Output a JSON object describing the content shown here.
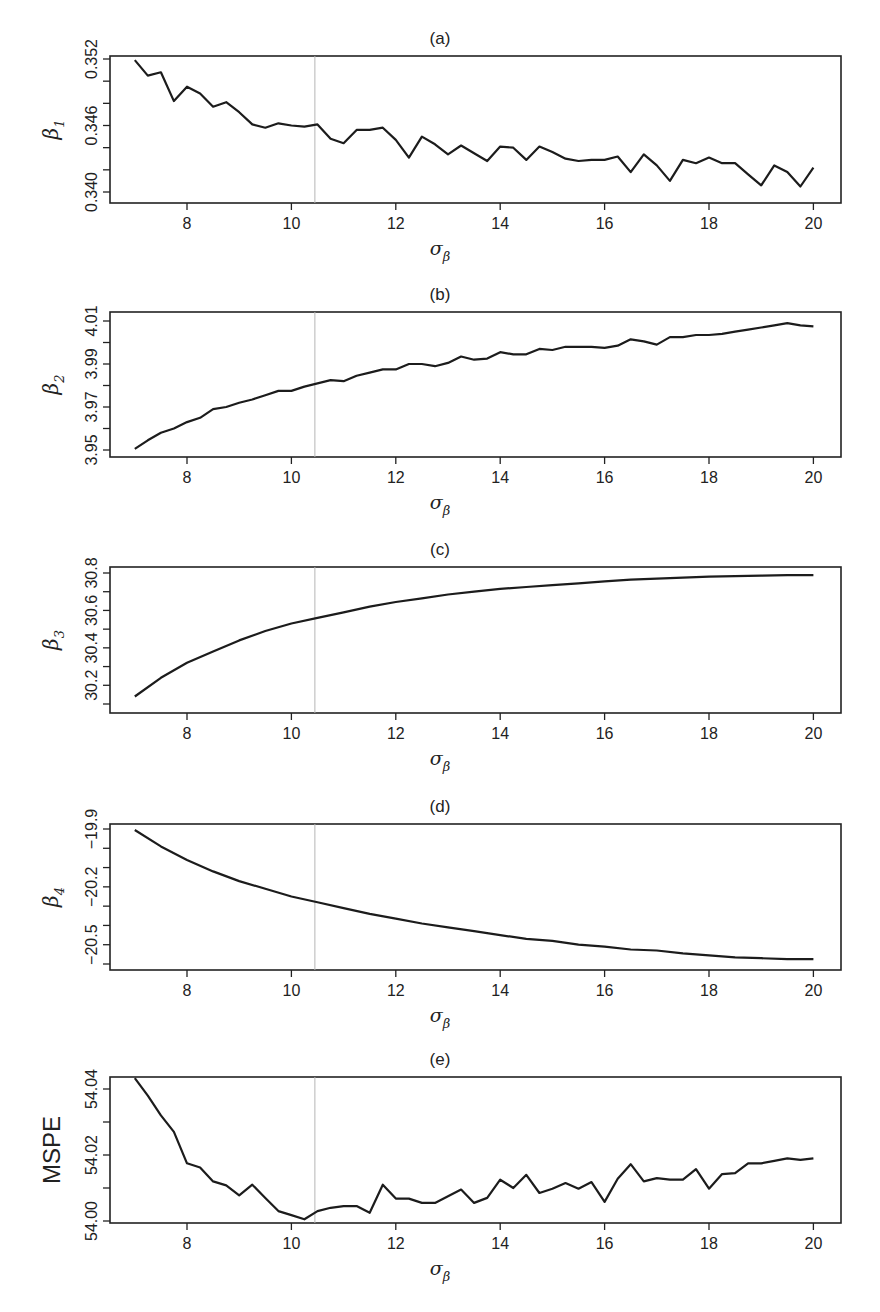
{
  "figure": {
    "x_axis": {
      "label": "σ",
      "label_subscript": "β",
      "ticks": [
        8,
        10,
        12,
        14,
        16,
        18,
        20
      ],
      "range": [
        6.52,
        20.52
      ]
    },
    "reference_line_x": 10.45
  },
  "chart_data": [
    {
      "type": "line",
      "panel": "(a)",
      "title": "(a)",
      "xlabel": "σβ",
      "ylabel": "β1",
      "ylabel_main": "β",
      "ylabel_sub": "1",
      "ylim": [
        0.3394,
        0.3527
      ],
      "yticks": [
        0.34,
        0.342,
        0.344,
        0.346,
        0.348,
        0.35,
        0.352
      ],
      "ytick_labels": [
        "0.340",
        "",
        "",
        "0.346",
        "",
        "",
        "0.352"
      ],
      "grid": false,
      "box": {
        "top": 56,
        "bottom": 203
      },
      "tick_px": {
        "top_value": 0.352,
        "top_y": 59,
        "bottom_value": 0.34,
        "bottom_y": 192
      },
      "x": [
        7,
        7.25,
        7.5,
        7.75,
        8,
        8.25,
        8.5,
        8.75,
        9,
        9.25,
        9.5,
        9.75,
        10,
        10.25,
        10.5,
        10.75,
        11,
        11.25,
        11.5,
        11.75,
        12,
        12.25,
        12.5,
        12.75,
        13,
        13.25,
        13.5,
        13.75,
        14,
        14.25,
        14.5,
        14.75,
        15,
        15.25,
        15.5,
        15.75,
        16,
        16.25,
        16.5,
        16.75,
        17,
        17.25,
        17.5,
        17.75,
        18,
        18.25,
        18.5,
        18.75,
        19,
        19.25,
        19.5,
        19.75,
        20
      ],
      "values": [
        0.3519,
        0.3505,
        0.3508,
        0.3482,
        0.3495,
        0.3489,
        0.3477,
        0.3481,
        0.3472,
        0.3461,
        0.3458,
        0.3462,
        0.346,
        0.3459,
        0.3461,
        0.3448,
        0.3444,
        0.3456,
        0.3456,
        0.3458,
        0.3447,
        0.3431,
        0.345,
        0.3443,
        0.3434,
        0.3442,
        0.3435,
        0.3428,
        0.3441,
        0.344,
        0.3429,
        0.3441,
        0.3436,
        0.343,
        0.3428,
        0.3429,
        0.3429,
        0.3432,
        0.3418,
        0.3434,
        0.3424,
        0.341,
        0.3429,
        0.3426,
        0.3431,
        0.3426,
        0.3426,
        0.3416,
        0.3406,
        0.3424,
        0.3418,
        0.3405,
        0.3422
      ]
    },
    {
      "type": "line",
      "panel": "(b)",
      "title": "(b)",
      "xlabel": "σβ",
      "ylabel": "β2",
      "ylabel_main": "β",
      "ylabel_sub": "2",
      "ylim": [
        3.9473,
        4.0143
      ],
      "yticks": [
        3.95,
        3.96,
        3.97,
        3.98,
        3.99,
        4.0,
        4.01
      ],
      "ytick_labels": [
        "3.95",
        "",
        "3.97",
        "",
        "3.99",
        "",
        "4.01"
      ],
      "grid": false,
      "box": {
        "top": 312,
        "bottom": 457
      },
      "tick_px": {
        "top_value": 4.01,
        "top_y": 321,
        "bottom_value": 3.95,
        "bottom_y": 450
      },
      "x": [
        7,
        7.25,
        7.5,
        7.75,
        8,
        8.25,
        8.5,
        8.75,
        9,
        9.25,
        9.5,
        9.75,
        10,
        10.25,
        10.5,
        10.75,
        11,
        11.25,
        11.5,
        11.75,
        12,
        12.25,
        12.5,
        12.75,
        13,
        13.25,
        13.5,
        13.75,
        14,
        14.25,
        14.5,
        14.75,
        15,
        15.25,
        15.5,
        15.75,
        16,
        16.25,
        16.5,
        16.75,
        17,
        17.25,
        17.5,
        17.75,
        18,
        18.25,
        18.5,
        18.75,
        19,
        19.25,
        19.5,
        19.75,
        20
      ],
      "values": [
        3.9505,
        3.9545,
        3.958,
        3.96,
        3.963,
        3.965,
        3.969,
        3.97,
        3.972,
        3.9735,
        3.9755,
        3.9775,
        3.9775,
        3.9795,
        3.981,
        3.9825,
        3.982,
        3.9845,
        3.986,
        3.9875,
        3.9875,
        3.99,
        3.99,
        3.989,
        3.9905,
        3.9935,
        3.992,
        3.9925,
        3.9955,
        3.9945,
        3.9945,
        3.997,
        3.9965,
        3.998,
        3.998,
        3.998,
        3.9975,
        3.9985,
        4.0015,
        4.0005,
        3.999,
        4.0025,
        4.0025,
        4.0035,
        4.0035,
        4.004,
        4.005,
        4.006,
        4.007,
        4.008,
        4.009,
        4.008,
        4.0075
      ]
    },
    {
      "type": "line",
      "panel": "(c)",
      "title": "(c)",
      "xlabel": "σβ",
      "ylabel": "β3",
      "ylabel_main": "β",
      "ylabel_sub": "3",
      "ylim": [
        30.03,
        30.83
      ],
      "yticks": [
        30.1,
        30.2,
        30.3,
        30.4,
        30.5,
        30.6,
        30.7,
        30.8
      ],
      "ytick_labels": [
        "",
        "30.2",
        "",
        "30.4",
        "",
        "30.6",
        "",
        "30.8"
      ],
      "grid": false,
      "box": {
        "top": 567,
        "bottom": 713
      },
      "tick_px": {
        "top_value": 30.8,
        "top_y": 573,
        "bottom_value": 30.1,
        "bottom_y": 704
      },
      "x": [
        7,
        7.5,
        8,
        8.5,
        9,
        9.5,
        10,
        10.5,
        11,
        11.5,
        12,
        12.5,
        13,
        13.5,
        14,
        14.5,
        15,
        15.5,
        16,
        16.5,
        17,
        17.5,
        18,
        18.5,
        19,
        19.5,
        20
      ],
      "values": [
        30.14,
        30.24,
        30.32,
        30.38,
        30.44,
        30.49,
        30.53,
        30.56,
        30.59,
        30.62,
        30.645,
        30.665,
        30.685,
        30.7,
        30.715,
        30.725,
        30.735,
        30.745,
        30.755,
        30.765,
        30.77,
        30.775,
        30.78,
        30.783,
        30.786,
        30.788,
        30.789
      ]
    },
    {
      "type": "line",
      "panel": "(d)",
      "title": "(d)",
      "xlabel": "σβ",
      "ylabel": "β4",
      "ylabel_main": "β",
      "ylabel_sub": "4",
      "ylim": [
        -20.63,
        -19.87
      ],
      "yticks": [
        -20.6,
        -20.5,
        -20.4,
        -20.3,
        -20.2,
        -20.1,
        -20.0,
        -19.9
      ],
      "ytick_labels": [
        "",
        "−20.5",
        "",
        "",
        "−20.2",
        "",
        "",
        "−19.9"
      ],
      "grid": false,
      "box": {
        "top": 824,
        "bottom": 970
      },
      "tick_px": {
        "top_value": -19.9,
        "top_y": 829,
        "bottom_value": -20.6,
        "bottom_y": 964
      },
      "x": [
        7,
        7.5,
        8,
        8.5,
        9,
        9.5,
        10,
        10.5,
        11,
        11.5,
        12,
        12.5,
        13,
        13.5,
        14,
        14.5,
        15,
        15.5,
        16,
        16.5,
        17,
        17.5,
        18,
        18.5,
        19,
        19.5,
        20
      ],
      "values": [
        -19.905,
        -19.99,
        -20.06,
        -20.12,
        -20.17,
        -20.21,
        -20.25,
        -20.28,
        -20.31,
        -20.34,
        -20.365,
        -20.39,
        -20.41,
        -20.43,
        -20.45,
        -20.47,
        -20.48,
        -20.5,
        -20.51,
        -20.525,
        -20.53,
        -20.545,
        -20.555,
        -20.565,
        -20.57,
        -20.575,
        -20.575
      ]
    },
    {
      "type": "line",
      "panel": "(e)",
      "title": "(e)",
      "xlabel": "σβ",
      "ylabel": "MSPE",
      "ylim": [
        53.9997,
        54.0437
      ],
      "yticks": [
        54.0,
        54.01,
        54.02,
        54.03,
        54.04
      ],
      "ytick_labels": [
        "54.00",
        "",
        "54.02",
        "",
        "54.04"
      ],
      "grid": false,
      "box": {
        "top": 1077,
        "bottom": 1223
      },
      "tick_px": {
        "top_value": 54.04,
        "top_y": 1089,
        "bottom_value": 54.0,
        "bottom_y": 1221
      },
      "x": [
        7,
        7.25,
        7.5,
        7.75,
        8,
        8.25,
        8.5,
        8.75,
        9,
        9.25,
        9.5,
        9.75,
        10,
        10.25,
        10.5,
        10.75,
        11,
        11.25,
        11.5,
        11.75,
        12,
        12.25,
        12.5,
        12.75,
        13,
        13.25,
        13.5,
        13.75,
        14,
        14.25,
        14.5,
        14.75,
        15,
        15.25,
        15.5,
        15.75,
        16,
        16.25,
        16.5,
        16.75,
        17,
        17.25,
        17.5,
        17.75,
        18,
        18.25,
        18.5,
        18.75,
        19,
        19.25,
        19.5,
        19.75,
        20
      ],
      "values": [
        54.0433,
        54.038,
        54.032,
        54.027,
        54.0175,
        54.0162,
        54.012,
        54.0108,
        54.0078,
        54.011,
        54.007,
        54.003,
        54.0018,
        54.0005,
        54.003,
        54.004,
        54.0045,
        54.0045,
        54.0025,
        54.011,
        54.0068,
        54.0068,
        54.0055,
        54.0055,
        54.0075,
        54.0095,
        54.0055,
        54.007,
        54.0125,
        54.01,
        54.014,
        54.0085,
        54.0098,
        54.0115,
        54.0098,
        54.0118,
        54.0058,
        54.0128,
        54.0172,
        54.012,
        54.013,
        54.0125,
        54.0125,
        54.0157,
        54.0098,
        54.0142,
        54.0145,
        54.0175,
        54.0175,
        54.0182,
        54.019,
        54.0185,
        54.019
      ]
    }
  ]
}
